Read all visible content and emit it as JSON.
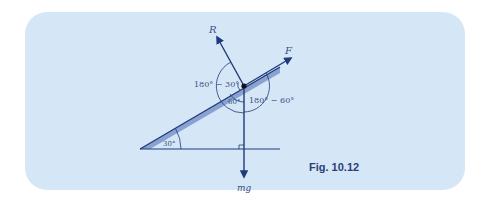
{
  "figure": {
    "caption": "Fig. 10.12",
    "background_color": "#d5e7f6",
    "line_color": "#1f3a7a",
    "label_color": "#3a4f86"
  },
  "forces": {
    "normal_reaction": "R",
    "applied_force": "F",
    "weight": "mg"
  },
  "angles": {
    "incline": "30°",
    "between_R_and_mg": "180° − 30°",
    "between_F_and_mg": "180° − 60°",
    "between_slope_and_mg": "60°"
  }
}
